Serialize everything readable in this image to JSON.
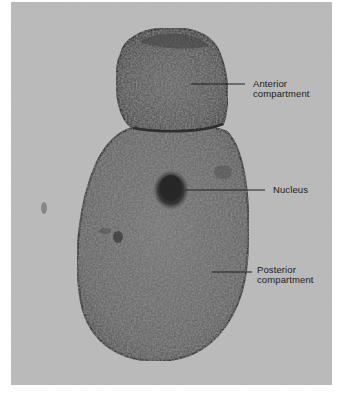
{
  "figure": {
    "type": "light micrograph",
    "background_color": "#b9b9b9",
    "cell_color": "#6e6e6e",
    "membrane_color": "#3a3a3a",
    "leader_line_color": "#202020"
  },
  "labels": [
    {
      "id": "anterior",
      "text": "Anterior\ncompartment"
    },
    {
      "id": "nucleus",
      "text": "Nucleus"
    },
    {
      "id": "posterior",
      "text": "Posterior\ncompartment"
    }
  ]
}
